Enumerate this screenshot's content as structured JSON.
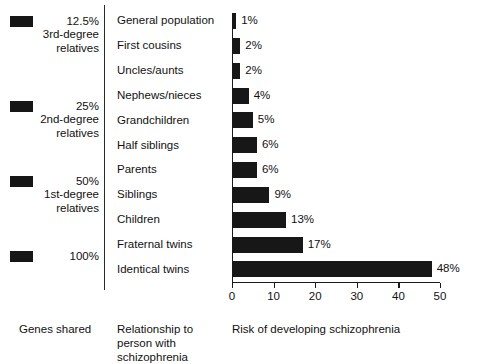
{
  "chart_data": {
    "type": "bar",
    "orientation": "horizontal",
    "title": "",
    "xlabel": "Risk of developing schizophrenia",
    "ylabel": "Relationship to person with schizophrenia",
    "xlim": [
      0,
      50
    ],
    "xticks": [
      0,
      10,
      20,
      30,
      40,
      50
    ],
    "xtick_labels": [
      "0",
      "10",
      "20",
      "30",
      "40",
      "50"
    ],
    "grid": false,
    "legend_position": "left",
    "bar_color": "#171717",
    "categories": [
      "General population",
      "First cousins",
      "Uncles/aunts",
      "Nephews/nieces",
      "Grandchildren",
      "Half siblings",
      "Parents",
      "Siblings",
      "Children",
      "Fraternal twins",
      "Identical twins"
    ],
    "values": [
      1,
      2,
      2,
      4,
      5,
      6,
      6,
      9,
      13,
      17,
      48
    ],
    "value_labels": [
      "1%",
      "2%",
      "2%",
      "4%",
      "5%",
      "6%",
      "6%",
      "9%",
      "13%",
      "17%",
      "48%"
    ]
  },
  "legend": {
    "caption": "Genes shared",
    "entries": [
      {
        "percent": "12.5%",
        "group": "3rd-degree\nrelatives"
      },
      {
        "percent": "25%",
        "group": "2nd-degree\nrelatives"
      },
      {
        "percent": "50%",
        "group": "1st-degree\nrelatives"
      },
      {
        "percent": "100%",
        "group": ""
      }
    ]
  },
  "captions": {
    "genes_shared": "Genes shared",
    "relationship": "Relationship to\nperson with\nschizophrenia",
    "risk_axis": "Risk of developing schizophrenia"
  }
}
